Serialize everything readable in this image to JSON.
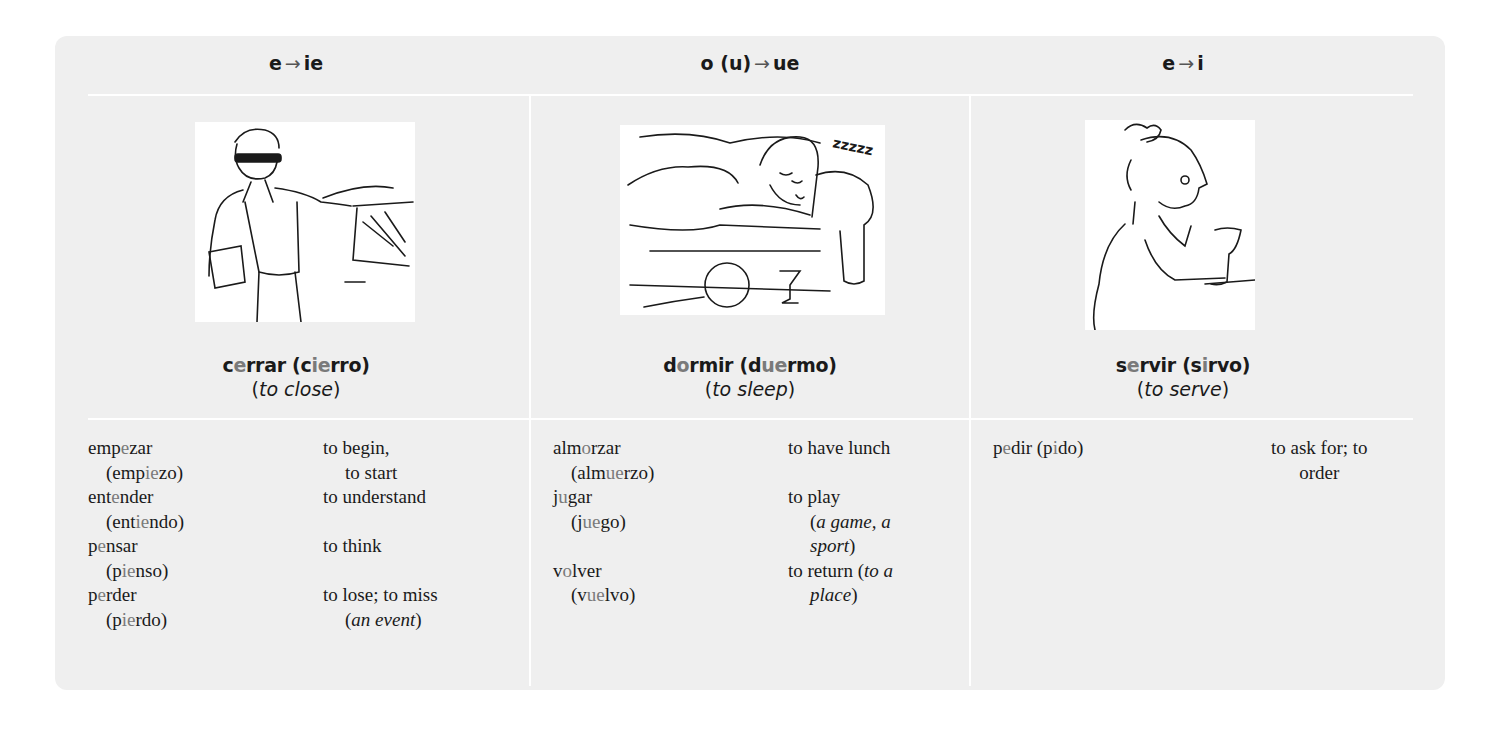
{
  "columns": [
    {
      "header": {
        "from": "e",
        "arrow": "→",
        "to": "ie"
      },
      "illustration": "man-closing-car-door",
      "featured": {
        "infinitive_parts": [
          "c",
          "e",
          "rrar"
        ],
        "yo_parts": [
          "(c",
          "ie",
          "rro)"
        ],
        "gloss_open": "(",
        "gloss": "to close",
        "gloss_close": ")"
      },
      "verbs": [
        {
          "inf": [
            "emp",
            "e",
            "zar"
          ],
          "yo": [
            "(emp",
            "ie",
            "zo)"
          ],
          "en_line1": "to begin,",
          "en_line2": "to start",
          "en_line2_italic": false
        },
        {
          "inf": [
            "ent",
            "e",
            "nder"
          ],
          "yo": [
            "(ent",
            "ie",
            "ndo)"
          ],
          "en_line1": "to understand",
          "en_line2": "",
          "en_line2_italic": false
        },
        {
          "inf": [
            "p",
            "e",
            "nsar"
          ],
          "yo": [
            "(p",
            "ie",
            "nso)"
          ],
          "en_line1": "to think",
          "en_line2": "",
          "en_line2_italic": false
        },
        {
          "inf": [
            "p",
            "e",
            "rder"
          ],
          "yo": [
            "(p",
            "ie",
            "rdo)"
          ],
          "en_line1": "to lose; to miss",
          "en_line2": "an event",
          "en_line2_italic": true
        }
      ]
    },
    {
      "header": {
        "from": "o (u)",
        "arrow": "→",
        "to": "ue"
      },
      "illustration": "woman-sleeping-on-couch",
      "featured": {
        "infinitive_parts": [
          "d",
          "o",
          "rmir"
        ],
        "yo_parts": [
          "(d",
          "ue",
          "rmo)"
        ],
        "gloss_open": "(",
        "gloss": "to sleep",
        "gloss_close": ")"
      },
      "verbs": [
        {
          "inf": [
            "alm",
            "o",
            "rzar"
          ],
          "yo": [
            "(alm",
            "ue",
            "rzo)"
          ],
          "en_line1": "to have lunch",
          "en_line2": "",
          "en_line2_italic": false
        },
        {
          "inf": [
            "j",
            "u",
            "gar"
          ],
          "yo": [
            "(j",
            "ue",
            "go)"
          ],
          "en_line1": "to play",
          "en_line2": "a game, a",
          "en_line3": "sport",
          "en_line2_italic": true
        },
        {
          "inf": [
            "v",
            "o",
            "lver"
          ],
          "yo": [
            "(v",
            "ue",
            "lvo)"
          ],
          "en_line1": "to return (",
          "en_line1_italic": "to a",
          "en_line2": "place",
          "en_line2_italic": true
        }
      ]
    },
    {
      "header": {
        "from": "e",
        "arrow": "→",
        "to": "i"
      },
      "illustration": "waitress-serving-drink",
      "featured": {
        "infinitive_parts": [
          "s",
          "e",
          "rvir"
        ],
        "yo_parts": [
          "(s",
          "i",
          "rvo)"
        ],
        "gloss_open": "(",
        "gloss": "to serve",
        "gloss_close": ")"
      },
      "verbs": [
        {
          "inf": [
            "p",
            "e",
            "dir"
          ],
          "yo": [
            "(p",
            "i",
            "do)"
          ],
          "en_line1": "to ask for; to",
          "en_line2": "order"
        }
      ]
    }
  ],
  "colors": {
    "panel_bg": "#efefef",
    "divider": "#ffffff",
    "text": "#1a1a1a",
    "stem_highlight": "#7a7a7a"
  }
}
